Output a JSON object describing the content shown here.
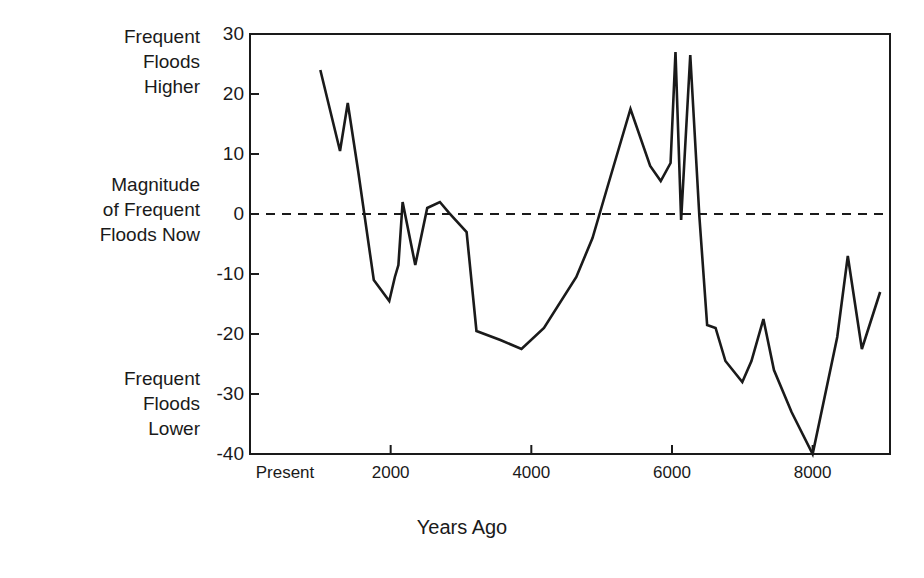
{
  "chart_data": {
    "type": "line",
    "title": "",
    "xlabel": "Years Ago",
    "ylabel": "",
    "xlim": [
      0,
      9100
    ],
    "ylim": [
      -40,
      30
    ],
    "grid": false,
    "legend": null,
    "zero_reference_line": {
      "value": 0,
      "style": "dashed",
      "label": "Magnitude of Frequent Floods Now"
    },
    "x_tick_labels": [
      "Present",
      "2000",
      "4000",
      "6000",
      "8000"
    ],
    "x_tick_values": [
      0,
      2000,
      4000,
      6000,
      8000
    ],
    "y_tick_labels": [
      "30",
      "20",
      "10",
      "0",
      "-10",
      "-20",
      "-30",
      "-40"
    ],
    "y_tick_values": [
      30,
      20,
      10,
      0,
      -10,
      -20,
      -30,
      -40
    ],
    "axis_annotations": {
      "top": "Frequent\nFloods\nHigher",
      "middle": "Magnitude\nof Frequent\nFloods Now",
      "bottom": "Frequent\nFloods\nLower"
    },
    "series": [
      {
        "name": "Flood magnitude anomaly",
        "color": "#1a1a1a",
        "x": [
          1000,
          1280,
          1390,
          1540,
          1760,
          1980,
          2060,
          2110,
          2170,
          2350,
          2520,
          2700,
          2830,
          3080,
          3220,
          3560,
          3860,
          4180,
          4640,
          4870,
          5070,
          5410,
          5690,
          5840,
          5980,
          6050,
          6130,
          6260,
          6390,
          6500,
          6620,
          6760,
          7000,
          7130,
          7300,
          7450,
          7700,
          8000,
          8350,
          8500,
          8700,
          8960
        ],
        "y": [
          24,
          10.5,
          18.5,
          7,
          -11,
          -14.5,
          -10.5,
          -8.5,
          2,
          -8.5,
          1,
          2,
          0.2,
          -3,
          -19.5,
          -21,
          -22.5,
          -19,
          -10.5,
          -4,
          4,
          17.5,
          8,
          5.5,
          8.5,
          27,
          -1,
          26.5,
          -0.5,
          -18.5,
          -19,
          -24.5,
          -28,
          -24.5,
          -17.5,
          -26,
          -33,
          -40,
          -20.5,
          -7,
          -22.5,
          -13
        ]
      }
    ]
  },
  "geometry": {
    "plot_left": 250,
    "plot_right": 890,
    "plot_top": 34,
    "plot_bottom": 454
  }
}
